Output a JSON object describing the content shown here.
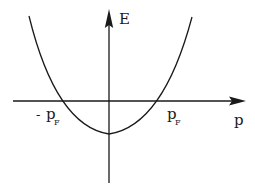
{
  "diagram": {
    "type": "dispersion-relation",
    "axes": {
      "vertical_label": "E",
      "horizontal_label": "p"
    },
    "curve": "parabola E(p) with minimum below p-axis",
    "ticks": {
      "left": {
        "prefix": "- ",
        "symbol": "p",
        "subscript": "F"
      },
      "right": {
        "prefix": "",
        "symbol": "p",
        "subscript": "F"
      }
    },
    "colors": {
      "ink": "#1a1a1a",
      "background": "#ffffff"
    }
  }
}
